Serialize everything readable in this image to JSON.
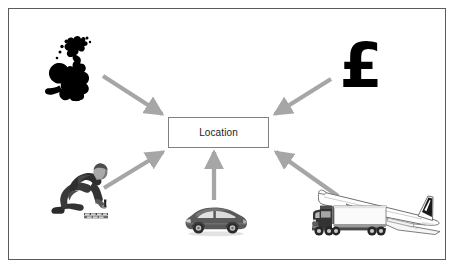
{
  "diagram": {
    "title": "Location",
    "center_node": {
      "label": "Location",
      "shape": "rectangle",
      "fill_color": "#ffffff",
      "border_color": "#808080"
    },
    "arrow_color": "#a6a6a6",
    "frame_color": "#5b5b5b",
    "background_color": "#ffffff",
    "nodes": [
      {
        "id": "uk-map",
        "icon_name": "uk-map-icon",
        "label": "British Isles map silhouette",
        "position": "top-left",
        "color": "#000000",
        "arrow_direction": "to-center"
      },
      {
        "id": "pound",
        "icon_name": "pound-sterling-icon",
        "label": "£",
        "position": "top-right",
        "color": "#000000",
        "arrow_direction": "to-center"
      },
      {
        "id": "worker",
        "icon_name": "kneeling-worker-icon",
        "label": "Kneeling worker",
        "position": "bottom-left",
        "color": "#3a3a3a",
        "arrow_direction": "to-center"
      },
      {
        "id": "car",
        "icon_name": "car-icon",
        "label": "Car",
        "position": "bottom-center",
        "color": "#595959",
        "arrow_direction": "to-center"
      },
      {
        "id": "truck",
        "icon_name": "truck-icon",
        "label": "Lorry",
        "position": "bottom-right",
        "color": "#f2f2f2",
        "arrow_direction": "to-center"
      },
      {
        "id": "plane",
        "icon_name": "airplane-icon",
        "label": "Concorde aircraft",
        "position": "bottom-right",
        "color": "#ffffff",
        "arrow_direction": "to-center"
      }
    ],
    "arrows": [
      {
        "id": "arrow-uk-to-center",
        "from": "uk-map",
        "to": "center-node"
      },
      {
        "id": "arrow-pound-to-center",
        "from": "pound",
        "to": "center-node"
      },
      {
        "id": "arrow-worker-to-center",
        "from": "worker",
        "to": "center-node"
      },
      {
        "id": "arrow-car-to-center",
        "from": "car",
        "to": "center-node"
      },
      {
        "id": "arrow-truck-to-center",
        "from": "truck",
        "to": "center-node"
      }
    ]
  }
}
